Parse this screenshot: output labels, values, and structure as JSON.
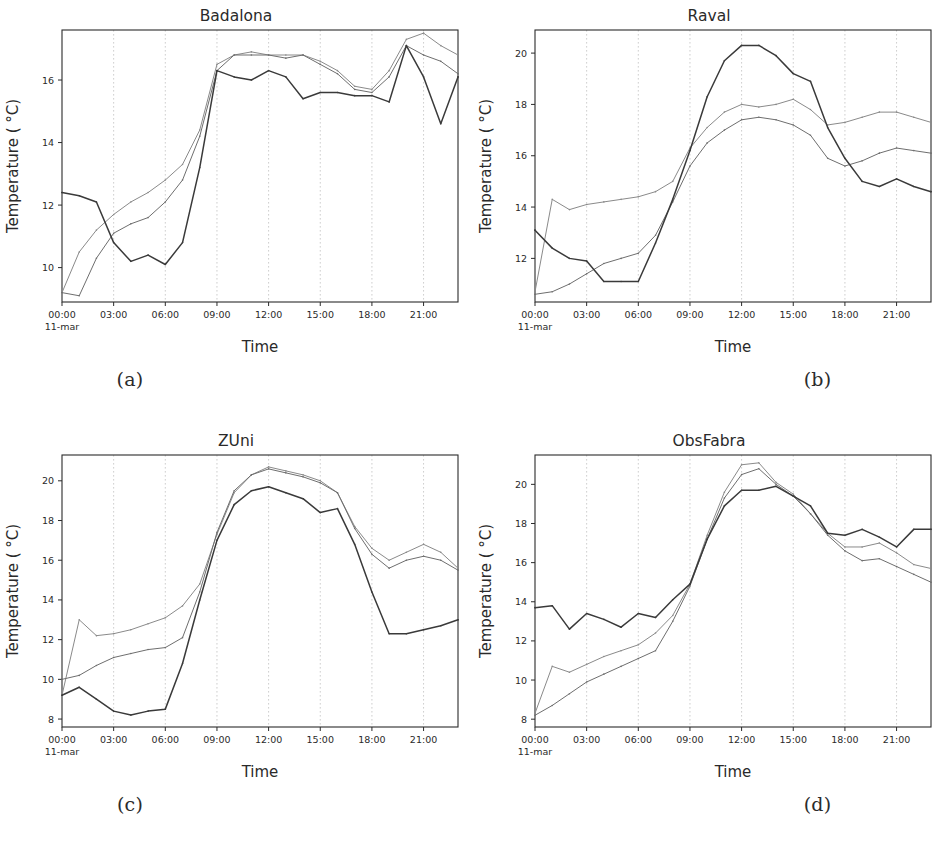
{
  "figure": {
    "background": "#ffffff",
    "captions": [
      "(a)",
      "(b)",
      "(c)",
      "(d)"
    ]
  },
  "axis_common": {
    "xlabel": "Time",
    "ylabel": "Temperature ( °C)",
    "xticklabels": [
      "00:00",
      "03:00",
      "06:00",
      "09:00",
      "12:00",
      "15:00",
      "18:00",
      "21:00"
    ],
    "xtick_sublabel": "11-mar",
    "xlim_hours": [
      0,
      23
    ],
    "grid": "vertical-dashed",
    "legend": "none"
  },
  "chart_data": [
    {
      "type": "line",
      "title": "Badalona",
      "xlabel": "Time",
      "ylabel": "Temperature ( °C)",
      "panel": "(a)",
      "x": [
        0,
        1,
        2,
        3,
        4,
        5,
        6,
        7,
        8,
        9,
        10,
        11,
        12,
        13,
        14,
        15,
        16,
        17,
        18,
        19,
        20,
        21,
        22,
        23
      ],
      "xticks": [
        0,
        3,
        6,
        9,
        12,
        15,
        18,
        21
      ],
      "xticklabels": [
        "00:00",
        "03:00",
        "06:00",
        "09:00",
        "12:00",
        "15:00",
        "18:00",
        "21:00"
      ],
      "yticks": [
        10,
        12,
        14,
        16
      ],
      "yticklabels": [
        "10",
        "12",
        "14",
        "16"
      ],
      "ylim": [
        8.9,
        17.6
      ],
      "series": [
        {
          "name": "observed",
          "color": "#3a3a3a",
          "width": 1.5,
          "values": [
            12.4,
            12.3,
            12.1,
            10.8,
            10.2,
            10.4,
            10.1,
            10.8,
            13.2,
            16.3,
            16.1,
            16.0,
            16.3,
            16.1,
            15.4,
            15.6,
            15.6,
            15.5,
            15.5,
            15.3,
            17.1,
            16.1,
            14.6,
            16.1
          ]
        },
        {
          "name": "model-1",
          "color": "#6e6e6e",
          "width": 1.0,
          "values": [
            9.2,
            9.1,
            10.3,
            11.1,
            11.4,
            11.6,
            12.1,
            12.8,
            14.2,
            16.3,
            16.8,
            16.8,
            16.8,
            16.7,
            16.8,
            16.5,
            16.2,
            15.7,
            15.6,
            16.1,
            17.1,
            16.8,
            16.6,
            16.2
          ]
        },
        {
          "name": "model-2",
          "color": "#8a8a8a",
          "width": 1.0,
          "values": [
            9.2,
            10.5,
            11.2,
            11.7,
            12.1,
            12.4,
            12.8,
            13.3,
            14.4,
            16.5,
            16.8,
            16.9,
            16.8,
            16.8,
            16.8,
            16.6,
            16.3,
            15.8,
            15.7,
            16.3,
            17.3,
            17.5,
            17.1,
            16.8
          ]
        }
      ]
    },
    {
      "type": "line",
      "title": "Raval",
      "xlabel": "Time",
      "ylabel": "Temperature ( °C)",
      "panel": "(b)",
      "x": [
        0,
        1,
        2,
        3,
        4,
        5,
        6,
        7,
        8,
        9,
        10,
        11,
        12,
        13,
        14,
        15,
        16,
        17,
        18,
        19,
        20,
        21,
        22,
        23
      ],
      "xticks": [
        0,
        3,
        6,
        9,
        12,
        15,
        18,
        21
      ],
      "xticklabels": [
        "00:00",
        "03:00",
        "06:00",
        "09:00",
        "12:00",
        "15:00",
        "18:00",
        "21:00"
      ],
      "yticks": [
        12,
        14,
        16,
        18,
        20
      ],
      "yticklabels": [
        "12",
        "14",
        "16",
        "18",
        "20"
      ],
      "ylim": [
        10.3,
        20.9
      ],
      "series": [
        {
          "name": "observed",
          "color": "#3a3a3a",
          "width": 1.5,
          "values": [
            13.1,
            12.4,
            12.0,
            11.9,
            11.1,
            11.1,
            11.1,
            12.6,
            14.3,
            16.2,
            18.3,
            19.7,
            20.3,
            20.3,
            19.9,
            19.2,
            18.9,
            17.1,
            15.9,
            15.0,
            14.8,
            15.1,
            14.8,
            14.6
          ]
        },
        {
          "name": "model-1",
          "color": "#6e6e6e",
          "width": 1.0,
          "values": [
            10.6,
            10.7,
            11.0,
            11.4,
            11.8,
            12.0,
            12.2,
            12.9,
            14.2,
            15.6,
            16.5,
            17.0,
            17.4,
            17.5,
            17.4,
            17.2,
            16.8,
            15.9,
            15.6,
            15.8,
            16.1,
            16.3,
            16.2,
            16.1
          ]
        },
        {
          "name": "model-2",
          "color": "#8a8a8a",
          "width": 1.0,
          "values": [
            10.7,
            14.3,
            13.9,
            14.1,
            14.2,
            14.3,
            14.4,
            14.6,
            15.0,
            16.3,
            17.1,
            17.7,
            18.0,
            17.9,
            18.0,
            18.2,
            17.8,
            17.2,
            17.3,
            17.5,
            17.7,
            17.7,
            17.5,
            17.3
          ]
        }
      ]
    },
    {
      "type": "line",
      "title": "ZUni",
      "xlabel": "Time",
      "ylabel": "Temperature ( °C)",
      "panel": "(c)",
      "x": [
        0,
        1,
        2,
        3,
        4,
        5,
        6,
        7,
        8,
        9,
        10,
        11,
        12,
        13,
        14,
        15,
        16,
        17,
        18,
        19,
        20,
        21,
        22,
        23
      ],
      "xticks": [
        0,
        3,
        6,
        9,
        12,
        15,
        18,
        21
      ],
      "xticklabels": [
        "00:00",
        "03:00",
        "06:00",
        "09:00",
        "12:00",
        "15:00",
        "18:00",
        "21:00"
      ],
      "yticks": [
        8,
        10,
        12,
        14,
        16,
        18,
        20
      ],
      "yticklabels": [
        "8",
        "10",
        "12",
        "14",
        "16",
        "18",
        "20"
      ],
      "ylim": [
        7.6,
        21.3
      ],
      "series": [
        {
          "name": "observed",
          "color": "#3a3a3a",
          "width": 1.5,
          "values": [
            9.2,
            9.6,
            9.0,
            8.4,
            8.2,
            8.4,
            8.5,
            10.8,
            14.0,
            17.0,
            18.8,
            19.5,
            19.7,
            19.4,
            19.1,
            18.4,
            18.6,
            16.8,
            14.4,
            12.3,
            12.3,
            12.5,
            12.7,
            13.0
          ]
        },
        {
          "name": "model-1",
          "color": "#6e6e6e",
          "width": 1.0,
          "values": [
            10.0,
            10.2,
            10.7,
            11.1,
            11.3,
            11.5,
            11.6,
            12.1,
            14.4,
            17.4,
            19.5,
            20.3,
            20.6,
            20.4,
            20.2,
            19.9,
            19.4,
            17.6,
            16.3,
            15.6,
            16.0,
            16.2,
            16.0,
            15.5
          ]
        },
        {
          "name": "model-2",
          "color": "#8a8a8a",
          "width": 1.0,
          "values": [
            9.2,
            13.0,
            12.2,
            12.3,
            12.5,
            12.8,
            13.1,
            13.7,
            14.8,
            17.3,
            19.4,
            20.3,
            20.7,
            20.5,
            20.3,
            20.0,
            19.4,
            17.7,
            16.6,
            16.0,
            16.4,
            16.8,
            16.4,
            15.6
          ]
        }
      ]
    },
    {
      "type": "line",
      "title": "ObsFabra",
      "xlabel": "Time",
      "ylabel": "Temperature ( °C)",
      "panel": "(d)",
      "x": [
        0,
        1,
        2,
        3,
        4,
        5,
        6,
        7,
        8,
        9,
        10,
        11,
        12,
        13,
        14,
        15,
        16,
        17,
        18,
        19,
        20,
        21,
        22,
        23
      ],
      "xticks": [
        0,
        3,
        6,
        9,
        12,
        15,
        18,
        21
      ],
      "xticklabels": [
        "00:00",
        "03:00",
        "06:00",
        "09:00",
        "12:00",
        "15:00",
        "18:00",
        "21:00"
      ],
      "yticks": [
        8,
        10,
        12,
        14,
        16,
        18,
        20
      ],
      "yticklabels": [
        "8",
        "10",
        "12",
        "14",
        "16",
        "18",
        "20"
      ],
      "ylim": [
        7.6,
        21.5
      ],
      "series": [
        {
          "name": "observed",
          "color": "#3a3a3a",
          "width": 1.5,
          "values": [
            13.7,
            13.8,
            12.6,
            13.4,
            13.1,
            12.7,
            13.4,
            13.2,
            14.1,
            14.9,
            17.2,
            18.9,
            19.7,
            19.7,
            19.9,
            19.4,
            18.9,
            17.5,
            17.4,
            17.7,
            17.3,
            16.8,
            17.7,
            17.7
          ]
        },
        {
          "name": "model-1",
          "color": "#6e6e6e",
          "width": 1.0,
          "values": [
            8.2,
            8.7,
            9.3,
            9.9,
            10.3,
            10.7,
            11.1,
            11.5,
            13.0,
            14.8,
            17.2,
            19.3,
            20.5,
            20.8,
            20.0,
            19.4,
            18.5,
            17.4,
            16.6,
            16.1,
            16.2,
            15.8,
            15.4,
            15.0
          ]
        },
        {
          "name": "model-2",
          "color": "#8a8a8a",
          "width": 1.0,
          "values": [
            8.3,
            10.7,
            10.4,
            10.8,
            11.2,
            11.5,
            11.8,
            12.4,
            13.3,
            14.9,
            17.4,
            19.6,
            21.0,
            21.1,
            20.1,
            19.5,
            18.5,
            17.5,
            16.8,
            16.8,
            17.0,
            16.5,
            15.9,
            15.7
          ]
        }
      ]
    }
  ]
}
